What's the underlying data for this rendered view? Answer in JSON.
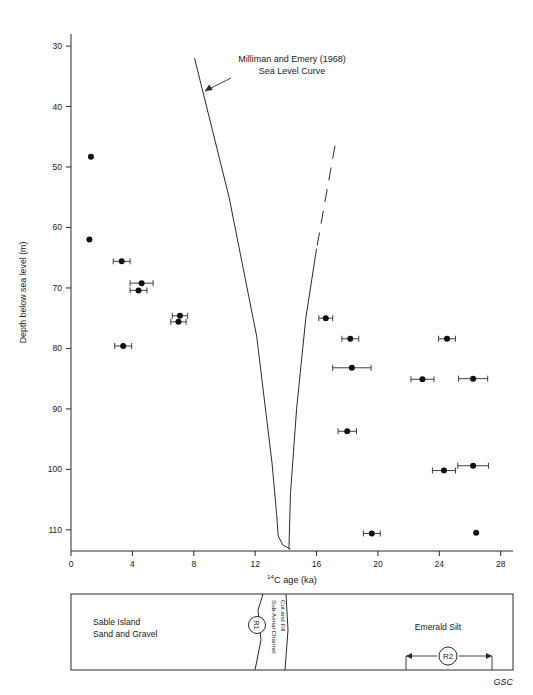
{
  "figure": {
    "annotation_line1": "Milliman and Emery (1968)",
    "annotation_line2": "Sea Level Curve",
    "credit": "GSC"
  },
  "chart_data": {
    "type": "scatter",
    "title": "",
    "xlabel_parts": {
      "sup": "14",
      "rest": "C age (ka)"
    },
    "xlabel": "14C age (ka)",
    "ylabel": "Depth below sea level (m)",
    "xlim": [
      0,
      28.8
    ],
    "ylim": [
      113.5,
      28.0
    ],
    "xticks": [
      0,
      4,
      8,
      12,
      16,
      20,
      24,
      28
    ],
    "xticklabels": [
      "0",
      "4",
      "8",
      "12",
      "16",
      "20",
      "24",
      "28"
    ],
    "yticks": [
      30,
      40,
      50,
      60,
      70,
      80,
      90,
      100,
      110
    ],
    "yticklabels": [
      "30",
      "40",
      "50",
      "60",
      "70",
      "80",
      "90",
      "100",
      "110"
    ],
    "grid": false,
    "legend": "none",
    "marker": "filled-circle",
    "points": [
      {
        "x": 1.3,
        "y": 48.3,
        "xerr": 0.0
      },
      {
        "x": 1.2,
        "y": 62.0,
        "xerr": 0.0
      },
      {
        "x": 3.3,
        "y": 65.6,
        "xerr": 0.55
      },
      {
        "x": 4.6,
        "y": 69.2,
        "xerr": 0.75
      },
      {
        "x": 4.4,
        "y": 70.4,
        "xerr": 0.55
      },
      {
        "x": 7.1,
        "y": 74.6,
        "xerr": 0.5
      },
      {
        "x": 7.0,
        "y": 75.6,
        "xerr": 0.5
      },
      {
        "x": 3.4,
        "y": 79.6,
        "xerr": 0.55
      },
      {
        "x": 16.6,
        "y": 75.0,
        "xerr": 0.45
      },
      {
        "x": 18.2,
        "y": 78.4,
        "xerr": 0.55
      },
      {
        "x": 18.3,
        "y": 83.2,
        "xerr": 1.25
      },
      {
        "x": 22.9,
        "y": 85.1,
        "xerr": 0.75
      },
      {
        "x": 26.2,
        "y": 85.0,
        "xerr": 0.95
      },
      {
        "x": 24.5,
        "y": 78.4,
        "xerr": 0.55
      },
      {
        "x": 18.0,
        "y": 93.7,
        "xerr": 0.6
      },
      {
        "x": 24.3,
        "y": 100.2,
        "xerr": 0.75
      },
      {
        "x": 26.2,
        "y": 99.4,
        "xerr": 1.0
      },
      {
        "x": 19.6,
        "y": 110.6,
        "xerr": 0.55
      },
      {
        "x": 26.4,
        "y": 110.5,
        "xerr": 0.0
      }
    ],
    "curves": [
      {
        "name": "milliman-emery-left-branch",
        "style": "solid",
        "points": [
          [
            8.05,
            32.0
          ],
          [
            10.3,
            55.0
          ],
          [
            12.1,
            78.0
          ],
          [
            13.1,
            99.0
          ],
          [
            13.4,
            107.5
          ],
          [
            13.5,
            111.0
          ],
          [
            13.8,
            112.5
          ],
          [
            14.3,
            113.2
          ]
        ]
      },
      {
        "name": "milliman-emery-right-branch-dashed",
        "style": "dashed",
        "points": [
          [
            17.2,
            46.5
          ],
          [
            16.6,
            55.0
          ],
          [
            16.0,
            63.5
          ]
        ]
      },
      {
        "name": "milliman-emery-right-branch-solid",
        "style": "solid",
        "points": [
          [
            16.0,
            63.5
          ],
          [
            15.3,
            75.0
          ],
          [
            14.7,
            90.0
          ],
          [
            14.3,
            104.0
          ],
          [
            14.2,
            113.2
          ]
        ]
      }
    ],
    "annotation": {
      "line1": "Milliman and Emery (1968)",
      "line2": "Sea Level Curve",
      "arrow_from": [
        10.2,
        36.8
      ],
      "arrow_to": [
        9.35,
        40.0
      ]
    }
  },
  "strat_panel": {
    "units": [
      {
        "id": "sable-island",
        "line1": "Sable Island",
        "line2": "Sand and Gravel"
      },
      {
        "id": "sub-aerial",
        "line1": "Sub-Aerial Channel",
        "line2": "Cut and Fill"
      },
      {
        "id": "emerald-silt",
        "line1": "Emerald Silt",
        "line2": ""
      }
    ],
    "markers": [
      {
        "id": "r1",
        "label": "R1"
      },
      {
        "id": "r2",
        "label": "R2"
      }
    ]
  }
}
